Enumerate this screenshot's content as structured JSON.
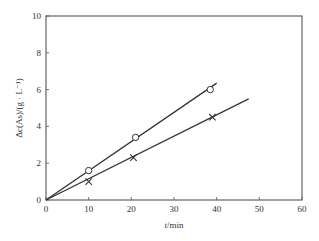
{
  "chart_data": {
    "type": "scatter",
    "title": "",
    "xlabel": "t/min",
    "xlabel_var": "t",
    "xlabel_unit": "/min",
    "ylabel": "Δc(As)/(g · L⁻¹)",
    "xlim": [
      0,
      60
    ],
    "ylim": [
      0,
      10
    ],
    "xticks": [
      0,
      10,
      20,
      30,
      40,
      50,
      60
    ],
    "yticks": [
      0,
      2,
      4,
      6,
      8,
      10
    ],
    "grid": false,
    "legend": null,
    "series": [
      {
        "name": "circles",
        "marker": "circle-open",
        "x": [
          10,
          21,
          38.5
        ],
        "y": [
          1.6,
          3.4,
          6.0
        ],
        "fit_line": {
          "x": [
            0,
            40
          ],
          "y": [
            0,
            6.35
          ]
        }
      },
      {
        "name": "crosses",
        "marker": "x",
        "x": [
          10,
          20.5,
          39
        ],
        "y": [
          1.0,
          2.3,
          4.5
        ],
        "fit_line": {
          "x": [
            0,
            47.5
          ],
          "y": [
            0,
            5.5
          ]
        }
      }
    ],
    "colors": {
      "axis": "#555555",
      "line": "#333333",
      "marker": "#333333"
    }
  }
}
